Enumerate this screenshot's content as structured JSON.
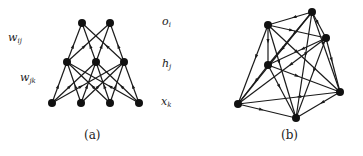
{
  "figure": {
    "panels": [
      {
        "id": "a",
        "caption": "(a)",
        "type": "layered-feedforward-network",
        "layers": [
          {
            "name": "output",
            "label_base": "o",
            "label_sub": "i",
            "nodes": [
              [
                82,
                23
              ],
              [
                110,
                23
              ]
            ]
          },
          {
            "name": "hidden",
            "label_base": "h",
            "label_sub": "j",
            "nodes": [
              [
                67,
                62
              ],
              [
                96,
                62
              ],
              [
                124,
                62
              ]
            ]
          },
          {
            "name": "input",
            "label_base": "x",
            "label_sub": "k",
            "nodes": [
              [
                52,
                103
              ],
              [
                81,
                103
              ],
              [
                110,
                103
              ],
              [
                139,
                103
              ]
            ]
          }
        ],
        "weight_labels": [
          {
            "base": "w",
            "sub": "ij",
            "between": "output-hidden"
          },
          {
            "base": "w",
            "sub": "jk",
            "between": "hidden-input"
          }
        ]
      },
      {
        "id": "b",
        "caption": "(b)",
        "type": "fully-connected-recurrent-network",
        "nodes": [
          [
            312,
            12
          ],
          [
            268,
            25
          ],
          [
            326,
            38
          ],
          [
            268,
            65
          ],
          [
            340,
            92
          ],
          [
            238,
            104
          ],
          [
            296,
            118
          ]
        ]
      }
    ]
  },
  "style": {
    "edge_color": "#1a1a1a",
    "node_color": "#111111",
    "node_radius": 4
  }
}
